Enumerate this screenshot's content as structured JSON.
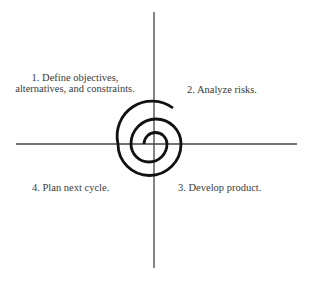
{
  "diagram": {
    "colors": {
      "axis": "#444444",
      "spiral": "#111111",
      "text": "#3a3a3a",
      "background": "#ffffff"
    },
    "axes": {
      "center": [
        154,
        144
      ],
      "vertical": {
        "x": 154,
        "y1": 12,
        "y2": 268
      },
      "horizontal": {
        "y": 144,
        "x1": 16,
        "x2": 297
      }
    },
    "quadrants": [
      {
        "id": "q1",
        "position": "top-left",
        "line1": "1. Define objectives,",
        "line2": "alternatives, and constraints."
      },
      {
        "id": "q2",
        "position": "top-right",
        "label": "2. Analyze risks."
      },
      {
        "id": "q3",
        "position": "bottom-right",
        "label": "3. Develop product."
      },
      {
        "id": "q4",
        "position": "bottom-left",
        "label": "4. Plan next cycle."
      }
    ],
    "spiral": {
      "turns": 2.6,
      "start": [
        144,
        144
      ],
      "end": [
        173,
        108
      ],
      "direction": "clockwise-outward"
    }
  }
}
